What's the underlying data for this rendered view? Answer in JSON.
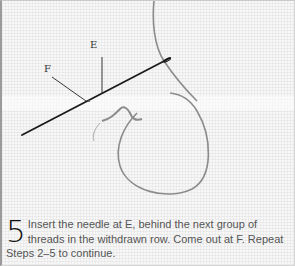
{
  "illustration": {
    "labels": {
      "e": "E",
      "f": "F"
    },
    "colors": {
      "needle": "#1a1a1a",
      "thread": "#8a8a8a",
      "fabric": "#f7f7f7",
      "leader_line": "#222222"
    }
  },
  "caption": {
    "step_number": "5",
    "text": "Insert the needle at E, behind the next group of threads in the withdrawn row. Come out at F. Repeat Steps 2–5 to continue."
  }
}
